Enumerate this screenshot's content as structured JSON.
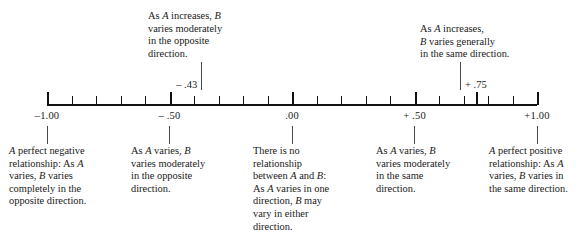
{
  "diagram": {
    "axis": {
      "min": -1.0,
      "max": 1.0,
      "tick_step": 0.05,
      "labels": [
        {
          "value": -1.0,
          "text": "–1.00"
        },
        {
          "value": -0.5,
          "text": "– .50"
        },
        {
          "value": 0.0,
          "text": ".00"
        },
        {
          "value": 0.5,
          "text": "+ .50"
        },
        {
          "value": 1.0,
          "text": "+1.00"
        }
      ]
    },
    "callouts": [
      {
        "value": -0.43,
        "value_text": "– .43",
        "text": "As A increases, B\nvaries moderately\nin the opposite\ndirection.",
        "align": "left"
      },
      {
        "value": 0.75,
        "value_text": "+ .75",
        "text": "As A increases,\nB varies generally\nin the same direction.",
        "align": "left"
      }
    ],
    "descriptions": [
      {
        "value": -1.0,
        "text": "A perfect negative\nrelationship: As A\nvaries, B varies\ncompletely in the\nopposite direction."
      },
      {
        "value": -0.5,
        "text": "As A varies, B\nvaries moderately\nin the opposite\ndirection."
      },
      {
        "value": 0.0,
        "text": "There is no\nrelationship\nbetween A and B:\nAs A varies in one\ndirection, B may\nvary in either\ndirection."
      },
      {
        "value": 0.5,
        "text": "As A varies, B\nvaries moderately\nin the same\ndirection."
      },
      {
        "value": 1.0,
        "text": "A perfect positive\nrelationship: As A\nvaries, B varies in\nthe same direction."
      }
    ]
  },
  "chart_data": {
    "type": "table",
    "xlabel": "Correlation coefficient",
    "xlim": [
      -1.0,
      1.0
    ],
    "grid": false,
    "legend": "none",
    "tick_labels": [
      "–1.00",
      "– .50",
      ".00",
      "+ .50",
      "+1.00"
    ],
    "tick_values": [
      -1.0,
      -0.5,
      0.0,
      0.5,
      1.0
    ],
    "minor_tick_step": 0.05,
    "annotations": [
      {
        "x": -0.43,
        "label": "– .43",
        "text": "As A increases, B varies moderately in the opposite direction."
      },
      {
        "x": 0.75,
        "label": "+ .75",
        "text": "As A increases, B varies generally in the same direction."
      },
      {
        "x": -1.0,
        "text": "A perfect negative relationship: As A varies, B varies completely in the opposite direction."
      },
      {
        "x": -0.5,
        "text": "As A varies, B varies moderately in the opposite direction."
      },
      {
        "x": 0.0,
        "text": "There is no relationship between A and B: As A varies in one direction, B may vary in either direction."
      },
      {
        "x": 0.5,
        "text": "As A varies, B varies moderately in the same direction."
      },
      {
        "x": 1.0,
        "text": "A perfect positive relationship: As A varies, B varies in the same direction."
      }
    ]
  }
}
